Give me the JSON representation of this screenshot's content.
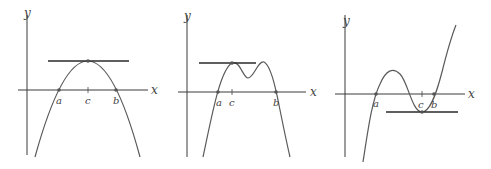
{
  "figure": {
    "panels": [
      {
        "id": "panel-1",
        "axis_labels": {
          "x": "x",
          "y": "y"
        },
        "point_labels": {
          "a": "a",
          "c": "c",
          "b": "b"
        },
        "shape": "downward parabola with maximum at c"
      },
      {
        "id": "panel-2",
        "axis_labels": {
          "x": "x",
          "y": "y"
        },
        "point_labels": {
          "a": "a",
          "c": "c",
          "b": "b"
        },
        "shape": "two-humped curve with horizontal tangent at first peak c"
      },
      {
        "id": "panel-3",
        "axis_labels": {
          "x": "x",
          "y": "y"
        },
        "point_labels": {
          "a": "a",
          "c": "c",
          "b": "b"
        },
        "shape": "cubic-like curve with horizontal tangent at local minimum c"
      }
    ]
  }
}
